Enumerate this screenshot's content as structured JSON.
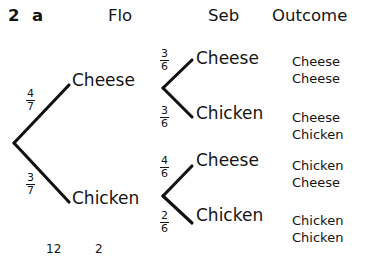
{
  "question": {
    "number": "2",
    "part": "a"
  },
  "headers": {
    "stage1": "Flo",
    "stage2": "Seb",
    "outcome": "Outcome"
  },
  "tree": {
    "stage1": [
      {
        "label": "Cheese",
        "probability": {
          "numerator": "4",
          "denominator": "7"
        },
        "children": [
          {
            "label": "Cheese",
            "probability": {
              "numerator": "3",
              "denominator": "6"
            },
            "outcome": {
              "first": "Cheese",
              "second": "Cheese"
            }
          },
          {
            "label": "Chicken",
            "probability": {
              "numerator": "3",
              "denominator": "6"
            },
            "outcome": {
              "first": "Cheese",
              "second": "Chicken"
            }
          }
        ]
      },
      {
        "label": "Chicken",
        "probability": {
          "numerator": "3",
          "denominator": "7"
        },
        "children": [
          {
            "label": "Cheese",
            "probability": {
              "numerator": "4",
              "denominator": "6"
            },
            "outcome": {
              "first": "Chicken",
              "second": "Cheese"
            }
          },
          {
            "label": "Chicken",
            "probability": {
              "numerator": "2",
              "denominator": "6"
            },
            "outcome": {
              "first": "Chicken",
              "second": "Chicken"
            }
          }
        ]
      }
    ]
  },
  "clipped": {
    "left": "12",
    "right": "2"
  },
  "colors": {
    "ink": "#141414",
    "line": "#111111",
    "background": "#ffffff"
  }
}
